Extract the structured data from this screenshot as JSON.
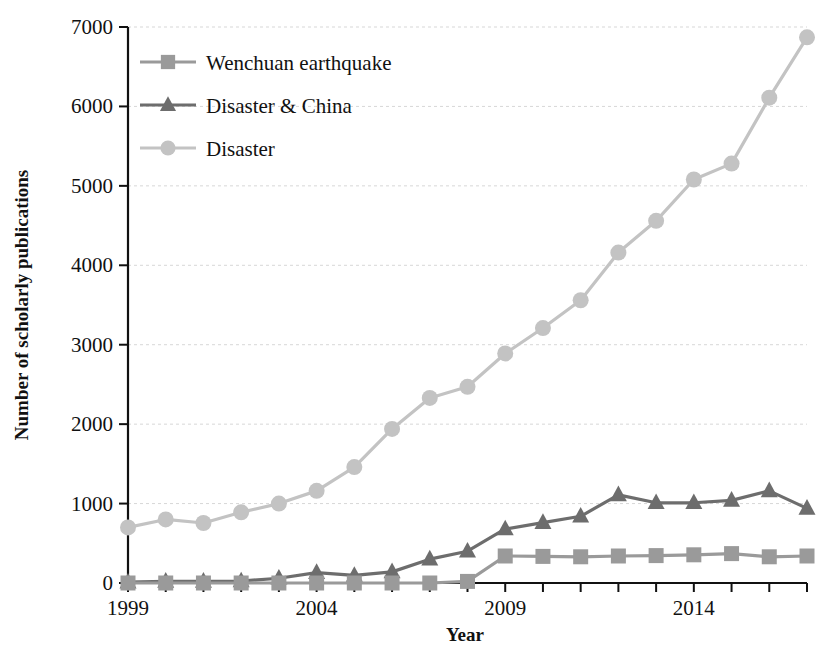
{
  "chart_data": {
    "type": "line",
    "title": "",
    "xlabel": "Year",
    "ylabel": "Number of scholarly publications",
    "xlim": [
      1999,
      2017
    ],
    "ylim": [
      0,
      7000
    ],
    "grid": true,
    "legend_position": "top-left",
    "x": [
      1999,
      2000,
      2001,
      2002,
      2003,
      2004,
      2005,
      2006,
      2007,
      2008,
      2009,
      2010,
      2011,
      2012,
      2013,
      2014,
      2015,
      2016,
      2017
    ],
    "xticks": [
      1999,
      2004,
      2009,
      2014
    ],
    "xtick_labels": [
      "1999",
      "2004",
      "2009",
      "2014"
    ],
    "yticks": [
      0,
      1000,
      2000,
      3000,
      4000,
      5000,
      6000,
      7000
    ],
    "ytick_labels": [
      "0",
      "1000",
      "2000",
      "3000",
      "4000",
      "5000",
      "6000",
      "7000"
    ],
    "series": [
      {
        "name": "Wenchuan earthquake",
        "marker": "square",
        "color": "#9a9a9a",
        "values": [
          0,
          0,
          0,
          0,
          0,
          0,
          0,
          0,
          0,
          20,
          340,
          335,
          330,
          340,
          345,
          355,
          370,
          330,
          340
        ]
      },
      {
        "name": "Disaster & China",
        "marker": "triangle",
        "color": "#6d6d6d",
        "values": [
          10,
          20,
          20,
          25,
          60,
          130,
          95,
          140,
          300,
          400,
          680,
          760,
          840,
          1110,
          1010,
          1010,
          1040,
          1160,
          940
        ]
      },
      {
        "name": "Disaster",
        "marker": "circle",
        "color": "#c3c3c3",
        "values": [
          700,
          800,
          755,
          890,
          1000,
          1160,
          1460,
          1940,
          2330,
          2470,
          2890,
          3210,
          3560,
          4160,
          4560,
          5080,
          5280,
          6110,
          6870
        ]
      }
    ]
  },
  "legend": {
    "items": [
      {
        "label": "Wenchuan earthquake"
      },
      {
        "label": "Disaster & China"
      },
      {
        "label": "Disaster"
      }
    ]
  }
}
